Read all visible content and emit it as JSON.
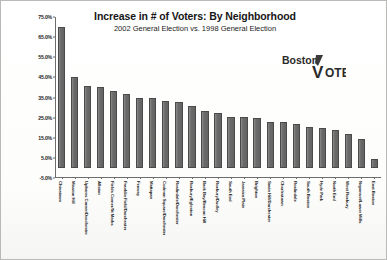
{
  "chart_data": {
    "type": "bar",
    "title": "Increase in # of Voters: By Neighborhood",
    "subtitle": "2002 General Election vs. 1998 General Election",
    "xlabel": "",
    "ylabel": "",
    "ylim": [
      -5,
      75
    ],
    "ytick_labels": [
      "75.0%",
      "65.0%",
      "55.0%",
      "45.0%",
      "35.0%",
      "25.0%",
      "15.0%",
      "5.0%",
      "-5.0%"
    ],
    "ytick_values": [
      75,
      65,
      55,
      45,
      35,
      25,
      15,
      5,
      -5
    ],
    "grid": false,
    "legend": null,
    "bar_color": "#6e6e6e",
    "categories": [
      "Chinatown",
      "Mission Hill",
      "Uphams Corner/Dorchester",
      "Allston",
      "Fields Corner/St Marks",
      "Franklin Field/Dorchester",
      "Fenway",
      "Mattapan",
      "Codman Square/Dorchester",
      "Roslindale/Dorchester",
      "Roxbury/Egleston",
      "Back Bay/Beacon Hill",
      "Roxbury/Dudley",
      "South End",
      "Jamaica Plain",
      "Brighton",
      "Savin Hill/Dorchester",
      "Charlestown",
      "Roslindale",
      "South Boston",
      "Hyde Park",
      "North End",
      "West Roxbury",
      "Neponset/Lower Mills",
      "East Boston"
    ],
    "values": [
      70.0,
      45.0,
      40.5,
      40.3,
      38.2,
      36.5,
      34.8,
      34.6,
      33.2,
      32.9,
      30.8,
      28.2,
      27.5,
      25.3,
      25.2,
      24.6,
      23.0,
      22.9,
      22.0,
      20.5,
      19.8,
      19.0,
      16.9,
      14.6,
      4.6
    ]
  },
  "logo": {
    "word1": "Boston",
    "word2": "V",
    "word3": "OTE"
  }
}
